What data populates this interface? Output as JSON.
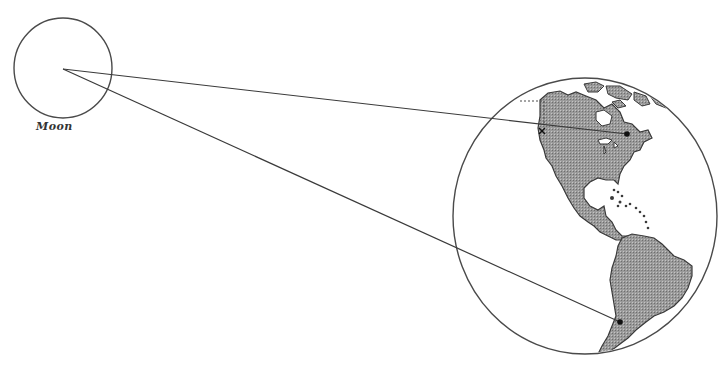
{
  "diagram": {
    "labels": {
      "moon": "Moon"
    },
    "colors": {
      "stroke": "#4a4a4a",
      "land": "#8c8c8c",
      "background": "#ffffff"
    },
    "moon": {
      "cx": 63,
      "cy": 68,
      "rx": 49,
      "ry": 50
    },
    "earth": {
      "cx": 585,
      "cy": 216,
      "rx": 132,
      "ry": 138
    },
    "sight_lines": [
      {
        "name": "northern-observer",
        "from": [
          63,
          69
        ],
        "to": [
          627,
          134
        ]
      },
      {
        "name": "southern-observer",
        "from": [
          63,
          69
        ],
        "to": [
          620,
          322
        ]
      }
    ],
    "observer_points": [
      {
        "name": "north-america-observer",
        "x": 627,
        "y": 134
      },
      {
        "name": "south-america-observer",
        "x": 620,
        "y": 322
      }
    ],
    "marks": [
      {
        "name": "west-coast-x-mark",
        "x": 542,
        "y": 131
      }
    ]
  }
}
